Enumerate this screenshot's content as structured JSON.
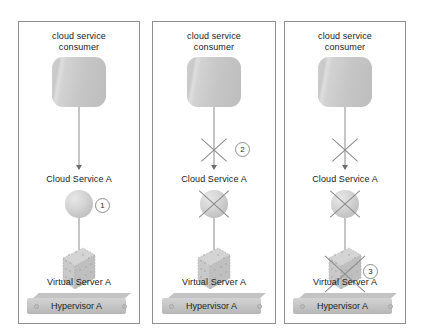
{
  "diagram": {
    "panels": [
      {
        "id": "panel-1",
        "consumer_label": "cloud service\nconsumer",
        "consumer_label_line1": "cloud service",
        "consumer_label_line2": "consumer",
        "service_label": "Cloud Service A",
        "server_label": "Virtual Server A",
        "hypervisor_label": "Hypervisor A",
        "callouts": [
          {
            "number": "1",
            "target": "cloud-service-sphere"
          }
        ],
        "crosses": []
      },
      {
        "id": "panel-2",
        "consumer_label_line1": "cloud service",
        "consumer_label_line2": "consumer",
        "service_label": "Cloud Service A",
        "server_label": "Virtual Server A",
        "hypervisor_label": "Hypervisor A",
        "callouts": [
          {
            "number": "2",
            "target": "consumer-connector"
          }
        ],
        "crosses": [
          "connector-arrow",
          "cloud-service-sphere"
        ]
      },
      {
        "id": "panel-3",
        "consumer_label_line1": "cloud service",
        "consumer_label_line2": "consumer",
        "service_label": "Cloud Service A",
        "server_label": "Virtual Server A",
        "hypervisor_label": "Hypervisor A",
        "callouts": [
          {
            "number": "3",
            "target": "virtual-server-cube"
          }
        ],
        "crosses": [
          "connector-arrow",
          "cloud-service-sphere",
          "virtual-server-cube"
        ]
      }
    ]
  },
  "colors": {
    "panel_border": "#8e8e8e",
    "background": "#ffffff",
    "shape_gray": "#c6c6c6",
    "line_gray": "#8b8b8b",
    "text": "#1a1a1a"
  }
}
